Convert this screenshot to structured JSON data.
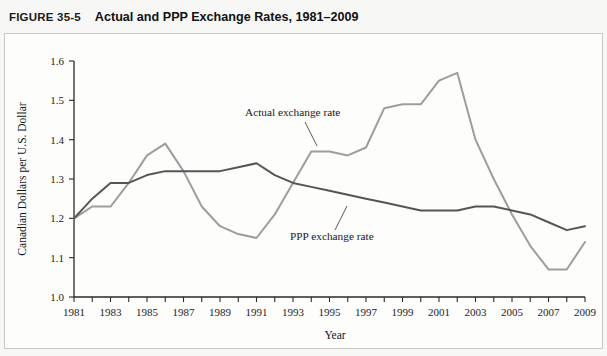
{
  "figure": {
    "number": "FIGURE 35-5",
    "title": "Actual and PPP Exchange Rates, 1981–2009"
  },
  "annotations": {
    "actual_label": "Actual exchange rate",
    "ppp_label": "PPP exchange rate"
  },
  "colors": {
    "actual_line": "#9d9d9d",
    "ppp_line": "#555555",
    "axis": "#2b2b2b",
    "panel_background": "#fdfdfc",
    "page_background": "#f7f7f5"
  },
  "chart_data": {
    "type": "line",
    "title": "Actual and PPP Exchange Rates, 1981–2009",
    "xlabel": "Year",
    "ylabel": "Canadian Dollars per U.S. Dollar",
    "xlim": [
      1981,
      2009
    ],
    "ylim": [
      1.0,
      1.6
    ],
    "yticks": [
      1.0,
      1.1,
      1.2,
      1.3,
      1.4,
      1.5,
      1.6
    ],
    "ytick_labels": [
      "1.0",
      "1.1",
      "1.2",
      "1.3",
      "1.4",
      "1.5",
      "1.6"
    ],
    "xticks": [
      1981,
      1982,
      1983,
      1984,
      1985,
      1986,
      1987,
      1988,
      1989,
      1990,
      1991,
      1992,
      1993,
      1994,
      1995,
      1996,
      1997,
      1998,
      1999,
      2000,
      2001,
      2002,
      2003,
      2004,
      2005,
      2006,
      2007,
      2008,
      2009
    ],
    "xtick_labels": [
      "1981",
      "",
      "1983",
      "",
      "1985",
      "",
      "1987",
      "",
      "1989",
      "",
      "1991",
      "",
      "1993",
      "",
      "1995",
      "",
      "1997",
      "",
      "1999",
      "",
      "2001",
      "",
      "2003",
      "",
      "2005",
      "",
      "2007",
      "",
      "2009"
    ],
    "grid": false,
    "legend": "inline-annotations",
    "x": [
      1981,
      1982,
      1983,
      1984,
      1985,
      1986,
      1987,
      1988,
      1989,
      1990,
      1991,
      1992,
      1993,
      1994,
      1995,
      1996,
      1997,
      1998,
      1999,
      2000,
      2001,
      2002,
      2003,
      2004,
      2005,
      2006,
      2007,
      2008,
      2009
    ],
    "series": [
      {
        "name": "Actual exchange rate",
        "color": "#9d9d9d",
        "values": [
          1.2,
          1.23,
          1.23,
          1.29,
          1.36,
          1.39,
          1.32,
          1.23,
          1.18,
          1.16,
          1.15,
          1.21,
          1.29,
          1.37,
          1.37,
          1.36,
          1.38,
          1.48,
          1.49,
          1.49,
          1.55,
          1.57,
          1.4,
          1.3,
          1.21,
          1.13,
          1.07,
          1.07,
          1.14
        ]
      },
      {
        "name": "PPP exchange rate",
        "color": "#555555",
        "values": [
          1.2,
          1.25,
          1.29,
          1.29,
          1.31,
          1.32,
          1.32,
          1.32,
          1.32,
          1.33,
          1.34,
          1.31,
          1.29,
          1.28,
          1.27,
          1.26,
          1.25,
          1.24,
          1.23,
          1.22,
          1.22,
          1.22,
          1.23,
          1.23,
          1.22,
          1.21,
          1.19,
          1.17,
          1.18
        ]
      }
    ]
  }
}
